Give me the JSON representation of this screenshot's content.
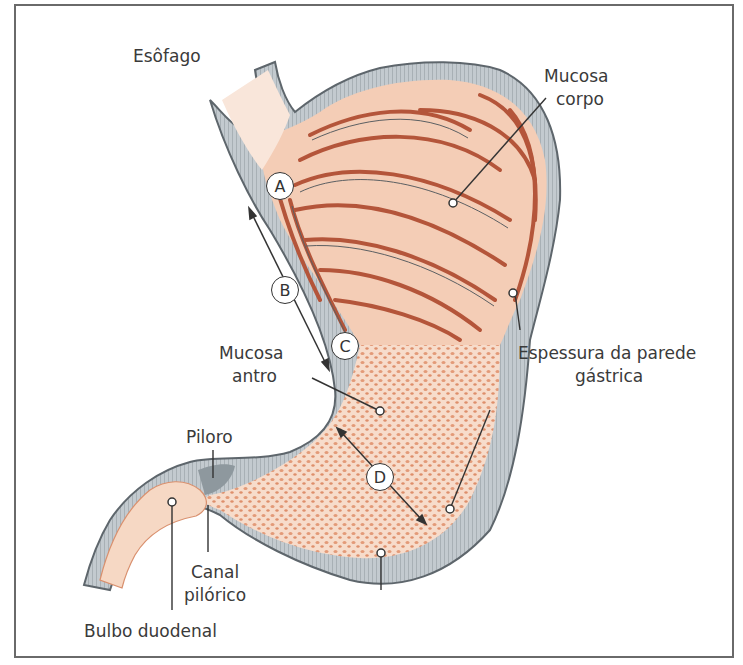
{
  "diagram": {
    "colors": {
      "frame": "#6a6a6a",
      "wall": "#b8c0c6",
      "wall_edge": "#5e666c",
      "mucosa_light": "#f6d6c2",
      "mucosa_fold": "#b4553a",
      "antrum_dots": "#e39a78",
      "text": "#3a3a3a"
    },
    "labels": {
      "esofago": "Esôfago",
      "mucosa_corpo_1": "Mucosa",
      "mucosa_corpo_2": "corpo",
      "mucosa_antro_1": "Mucosa",
      "mucosa_antro_2": "antro",
      "espessura_1": "Espessura da parede",
      "espessura_2": "gástrica",
      "piloro": "Piloro",
      "canal_1": "Canal",
      "canal_2": "pilórico",
      "bulbo": "Bulbo duodenal"
    },
    "markers": {
      "a": "A",
      "b": "B",
      "c": "C",
      "d": "D"
    }
  }
}
